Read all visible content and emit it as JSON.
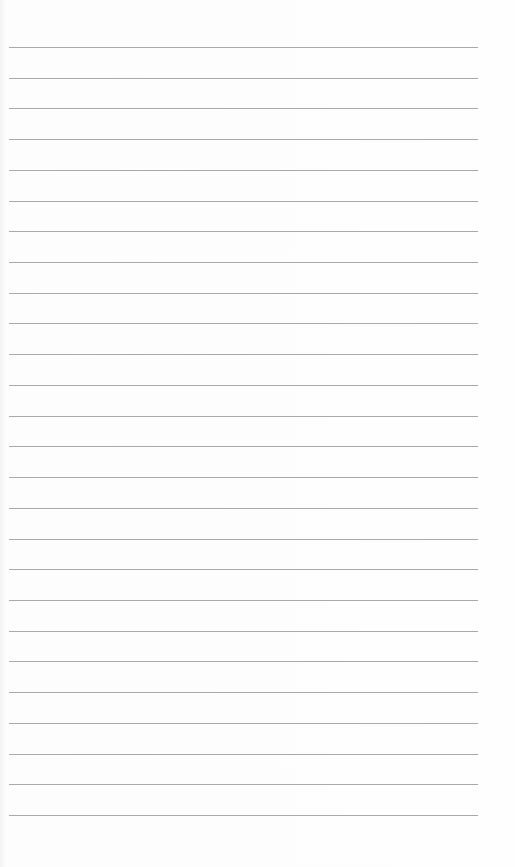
{
  "page": {
    "type": "lined-paper",
    "line_color": "#a9a9a9",
    "background": "#fdfdfd",
    "line_count": 26,
    "first_line_y": 47,
    "line_spacing": 30.72,
    "line_left": 9,
    "line_width": 469
  }
}
